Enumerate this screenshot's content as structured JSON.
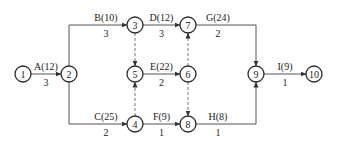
{
  "diagram": {
    "type": "activity-on-arrow network",
    "nodes": [
      {
        "id": "1",
        "label": "1",
        "x": 23,
        "y": 74
      },
      {
        "id": "2",
        "label": "2",
        "x": 69,
        "y": 74
      },
      {
        "id": "3",
        "label": "3",
        "x": 135,
        "y": 25
      },
      {
        "id": "4",
        "label": "4",
        "x": 135,
        "y": 124
      },
      {
        "id": "5",
        "label": "5",
        "x": 135,
        "y": 74
      },
      {
        "id": "6",
        "label": "6",
        "x": 188,
        "y": 74
      },
      {
        "id": "7",
        "label": "7",
        "x": 188,
        "y": 25
      },
      {
        "id": "8",
        "label": "8",
        "x": 188,
        "y": 124
      },
      {
        "id": "9",
        "label": "9",
        "x": 256,
        "y": 74
      },
      {
        "id": "10",
        "label": "10",
        "x": 314,
        "y": 74
      }
    ],
    "activities": [
      {
        "name": "A(12)",
        "duration": "3",
        "from": "1",
        "to": "2"
      },
      {
        "name": "B(10)",
        "duration": "3",
        "from": "2",
        "to": "3"
      },
      {
        "name": "C(25)",
        "duration": "2",
        "from": "2",
        "to": "4"
      },
      {
        "name": "D(12)",
        "duration": "3",
        "from": "3",
        "to": "7"
      },
      {
        "name": "E(22)",
        "duration": "2",
        "from": "5",
        "to": "6"
      },
      {
        "name": "F(9)",
        "duration": "1",
        "from": "4",
        "to": "8"
      },
      {
        "name": "G(24)",
        "duration": "2",
        "from": "7",
        "to": "9"
      },
      {
        "name": "H(8)",
        "duration": "1",
        "from": "8",
        "to": "9"
      },
      {
        "name": "I(9)",
        "duration": "1",
        "from": "9",
        "to": "10"
      }
    ],
    "dummies": [
      {
        "from": "3",
        "to": "5"
      },
      {
        "from": "4",
        "to": "5"
      },
      {
        "from": "6",
        "to": "7"
      },
      {
        "from": "6",
        "to": "8"
      }
    ]
  }
}
